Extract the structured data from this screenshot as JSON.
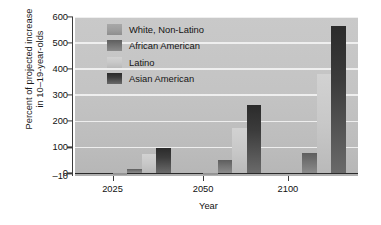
{
  "chart_data": {
    "type": "bar",
    "title": "",
    "subtitle": "",
    "xlabel": "Year",
    "ylabel": "Percent of projected increase in 10–19-year-olds",
    "ylabel_lines": [
      "Percent of projected increase",
      "in 10–19-year-olds"
    ],
    "categories": [
      "2025",
      "2050",
      "2100"
    ],
    "series": [
      {
        "name": "White, Non-Latino",
        "values": [
          -8,
          -8,
          0
        ],
        "color": "#9a9a9a"
      },
      {
        "name": "African American",
        "values": [
          15,
          50,
          80
        ],
        "color": "#6e6e6e"
      },
      {
        "name": "Latino",
        "values": [
          75,
          175,
          380
        ],
        "color": "#c3c3c3"
      },
      {
        "name": "Asian American",
        "values": [
          97,
          262,
          565
        ],
        "color": "#3a3a3a"
      }
    ],
    "ylim": [
      -10,
      600
    ],
    "yticks": [
      -10,
      0,
      100,
      200,
      300,
      400,
      500,
      600
    ],
    "ytick_labels": [
      "–10",
      "0",
      "100",
      "200",
      "300",
      "400",
      "500",
      "600"
    ],
    "grid": true,
    "gridlines_at": [
      100,
      200,
      300,
      400,
      500,
      600
    ],
    "legend_position": "upper-left-inside",
    "plot_background": "#c4c4c4",
    "gridline_color": "#f2f2f2",
    "axis_color": "#2a2a2a"
  },
  "legend": {
    "items": [
      {
        "label": "White, Non-Latino"
      },
      {
        "label": "African American"
      },
      {
        "label": "Latino"
      },
      {
        "label": "Asian American"
      }
    ]
  },
  "axes": {
    "x": {
      "label": "Year",
      "tick_labels": [
        "2025",
        "2050",
        "2100"
      ]
    },
    "y": {
      "tick_labels": [
        "600",
        "500",
        "400",
        "300",
        "200",
        "100",
        "0",
        "–10"
      ]
    }
  }
}
